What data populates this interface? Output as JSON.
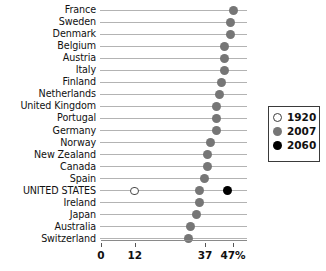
{
  "chart_data": {
    "type": "scatter",
    "subtype": "dot-plot",
    "title": "",
    "xlabel": "",
    "ylabel": "",
    "xlim": [
      0,
      50
    ],
    "xticks": [
      0,
      12,
      37,
      47
    ],
    "xtick_labels": [
      "0",
      "12",
      "37",
      "47%"
    ],
    "grid": true,
    "grid_orientation": "horizontal-rules",
    "legend_position": "middle-right",
    "categories": [
      "France",
      "Sweden",
      "Denmark",
      "Belgium",
      "Austria",
      "Italy",
      "Finland",
      "Netherlands",
      "United Kingdom",
      "Portugal",
      "Germany",
      "Norway",
      "New Zealand",
      "Canada",
      "Spain",
      "UNITED STATES",
      "Ireland",
      "Japan",
      "Australia",
      "Switzerland"
    ],
    "series": [
      {
        "name": "1920",
        "color": "#ffffff",
        "marker": "open-circle",
        "values": [
          null,
          null,
          null,
          null,
          null,
          null,
          null,
          null,
          null,
          null,
          null,
          null,
          null,
          null,
          null,
          12,
          null,
          null,
          null,
          null
        ]
      },
      {
        "name": "2007",
        "color": "#767676",
        "marker": "filled-circle",
        "values": [
          47,
          46,
          46,
          44,
          44,
          44,
          43,
          42,
          41,
          41,
          41,
          39,
          38,
          38,
          37,
          35,
          35,
          34,
          32,
          31
        ]
      },
      {
        "name": "2060",
        "color": "#000000",
        "marker": "filled-circle",
        "values": [
          null,
          null,
          null,
          null,
          null,
          null,
          null,
          null,
          null,
          null,
          null,
          null,
          null,
          null,
          null,
          45,
          null,
          null,
          null,
          null
        ]
      }
    ],
    "legend": [
      {
        "label": "1920",
        "marker": "open-circle",
        "color": "#ffffff"
      },
      {
        "label": "2007",
        "marker": "filled-circle",
        "color": "#767676"
      },
      {
        "label": "2060",
        "marker": "filled-circle",
        "color": "#000000"
      }
    ],
    "axis": {
      "x_pixel_zero": 101,
      "x_pixel_per_unit": 2.81
    }
  },
  "colors": {
    "dot_2007": "#767676",
    "dot_2060": "#000000",
    "dot_1920_border": "#4a4a4a",
    "rule": "#b3b3b3",
    "axis": "#8a8a8a",
    "text": "#111111"
  }
}
